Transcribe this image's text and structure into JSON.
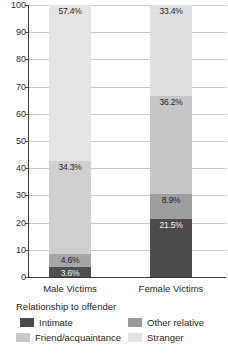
{
  "chart_data": {
    "type": "bar",
    "stacked": true,
    "title": "",
    "subtitle": "",
    "xlabel": "",
    "ylabel": "",
    "ylim": [
      0,
      100
    ],
    "yticks": [
      0,
      10,
      20,
      30,
      40,
      50,
      60,
      70,
      80,
      90,
      100
    ],
    "ytick_labels": [
      "0",
      "10",
      "20",
      "30",
      "40",
      "50",
      "60",
      "70",
      "80",
      "90",
      "100"
    ],
    "grid": true,
    "legend_title": "Relationship to offender",
    "legend_position": "bottom",
    "categories": [
      "Male Victims",
      "Female Victims"
    ],
    "series": [
      {
        "name": "Intimate",
        "values": [
          3.6,
          21.5
        ],
        "color": "#4a4a4a",
        "labels": [
          "3.6%",
          "21.5%"
        ]
      },
      {
        "name": "Other relative",
        "values": [
          4.6,
          8.9
        ],
        "color": "#9a9a9a",
        "labels": [
          "4.6%",
          "8.9%"
        ]
      },
      {
        "name": "Friend/acquaintance",
        "values": [
          34.3,
          36.2
        ],
        "color": "#c9c9c9",
        "labels": [
          "34.3%",
          "36.2%"
        ]
      },
      {
        "name": "Stranger",
        "values": [
          57.4,
          33.4
        ],
        "color": "#e2e2e2",
        "labels": [
          "57.4%",
          "33.4%"
        ]
      }
    ]
  },
  "axis": {
    "y_ticks": [
      "100",
      "90",
      "80",
      "70",
      "60",
      "50",
      "40",
      "30",
      "20",
      "10",
      "0"
    ]
  },
  "categories": {
    "male": "Male Victims",
    "female": "Female Victims"
  },
  "legend": {
    "title": "Relationship to offender",
    "items": [
      {
        "label": "Intimate",
        "color": "#4a4a4a"
      },
      {
        "label": "Other relative",
        "color": "#9a9a9a"
      },
      {
        "label": "Friend/acquaintance",
        "color": "#c9c9c9"
      },
      {
        "label": "Stranger",
        "color": "#e2e2e2"
      }
    ]
  },
  "bars": {
    "male": [
      {
        "label": "57.4%",
        "value": 57.4,
        "series": "Stranger",
        "color": "#e4e4e4",
        "dark": false
      },
      {
        "label": "34.3%",
        "value": 34.3,
        "series": "Friend/acquaintance",
        "color": "#cfcfcf",
        "dark": false
      },
      {
        "label": "4.6%",
        "value": 4.6,
        "series": "Other relative",
        "color": "#a6a6a6",
        "dark": false
      },
      {
        "label": "3.6%",
        "value": 3.6,
        "series": "Intimate",
        "color": "#4f4f4f",
        "dark": true
      }
    ],
    "female": [
      {
        "label": "33.4%",
        "value": 33.4,
        "series": "Stranger",
        "color": "#e0e0e0",
        "dark": false
      },
      {
        "label": "36.2%",
        "value": 36.2,
        "series": "Friend/acquaintance",
        "color": "#c6c6c6",
        "dark": false
      },
      {
        "label": "8.9%",
        "value": 8.9,
        "series": "Other relative",
        "color": "#9e9e9e",
        "dark": false
      },
      {
        "label": "21.5%",
        "value": 21.5,
        "series": "Intimate",
        "color": "#4b4b4b",
        "dark": true
      }
    ]
  }
}
